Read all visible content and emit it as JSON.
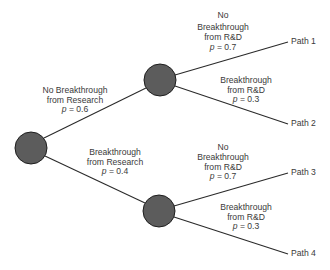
{
  "diagram": {
    "type": "decision-tree",
    "colors": {
      "node_fill": "#5c5c5c",
      "node_stroke": "#1e1e1e",
      "edge": "#2a2a2a",
      "text": "#3a3a3a"
    },
    "nodes": [
      {
        "id": "root",
        "cx": 31,
        "cy": 148,
        "r": 16
      },
      {
        "id": "no_breakthrough_research",
        "cx": 160,
        "cy": 80,
        "r": 16
      },
      {
        "id": "breakthrough_research",
        "cx": 159,
        "cy": 211,
        "r": 16
      }
    ],
    "branches": {
      "research_no": {
        "lines": [
          "No Breakthrough",
          "from Research"
        ],
        "p_label": "p",
        "p_value": "= 0.6"
      },
      "research_yes": {
        "lines": [
          "Breakthrough",
          "from Research"
        ],
        "p_label": "p",
        "p_value": "= 0.4"
      },
      "rd_top_no": {
        "lines": [
          "No",
          "Breakthrough",
          "from R&D"
        ],
        "p_label": "p",
        "p_value": "= 0.7"
      },
      "rd_top_yes": {
        "lines": [
          "Breakthrough",
          "from R&D"
        ],
        "p_label": "p",
        "p_value": "= 0.3"
      },
      "rd_bottom_no": {
        "lines": [
          "No",
          "Breakthrough",
          "from R&D"
        ],
        "p_label": "p",
        "p_value": "= 0.7"
      },
      "rd_bottom_yes": {
        "lines": [
          "Breakthrough",
          "from R&D"
        ],
        "p_label": "p",
        "p_value": "= 0.3"
      }
    },
    "outcomes": [
      {
        "label": "Path 1"
      },
      {
        "label": "Path 2"
      },
      {
        "label": "Path 3"
      },
      {
        "label": "Path 4"
      }
    ]
  }
}
